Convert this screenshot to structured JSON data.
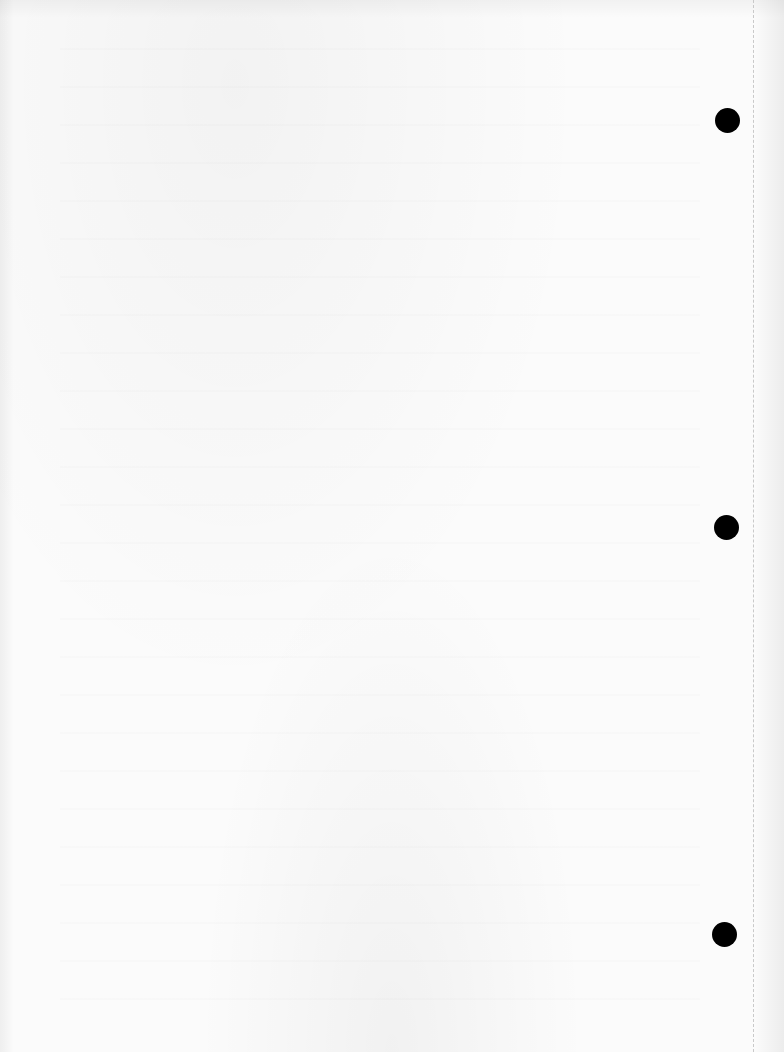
{
  "page": {
    "type": "scanned binder paper sheet",
    "background_color": "#fbfbfb",
    "text_content": [],
    "punch_holes": [
      {
        "name": "top",
        "color": "#000000"
      },
      {
        "name": "middle",
        "color": "#000000"
      },
      {
        "name": "bottom",
        "color": "#000000"
      }
    ],
    "margin_line": {
      "style": "dashed",
      "color": "#c9c9c9"
    }
  }
}
